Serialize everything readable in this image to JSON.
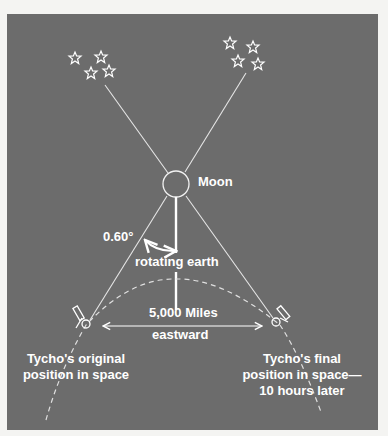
{
  "figure": {
    "background_color": "#6c6c6c",
    "line_color": "#e8e8e8",
    "labels": {
      "moon": "Moon",
      "angle": "0.60°",
      "rotating_earth": "rotating earth",
      "distance_line1": "5,000 Miles",
      "distance_line2": "eastward",
      "original_line1": "Tycho's original",
      "original_line2": "position in space",
      "final_line1": "Tycho's final",
      "final_line2": "position in space—",
      "final_line3": "10 hours later"
    },
    "elements": {
      "star_groups": [
        "left-star-cluster",
        "right-star-cluster"
      ],
      "telescopes": [
        "left-telescope",
        "right-telescope"
      ],
      "moon": "moon-circle"
    }
  }
}
